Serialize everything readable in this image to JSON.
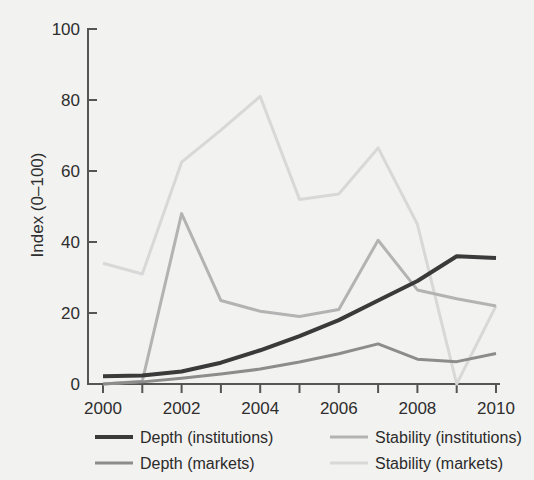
{
  "chart_data": {
    "type": "line",
    "title": "",
    "subtitle": "",
    "xlabel": "",
    "ylabel": "Index (0–100)",
    "x": [
      2000,
      2001,
      2002,
      2003,
      2004,
      2005,
      2006,
      2007,
      2008,
      2009,
      2010
    ],
    "xlim": [
      2000,
      2010
    ],
    "ylim": [
      0,
      100
    ],
    "xticks": [
      2000,
      2001,
      2002,
      2003,
      2004,
      2005,
      2006,
      2007,
      2008,
      2009,
      2010
    ],
    "xticklabels": [
      "2000",
      "",
      "2002",
      "",
      "2004",
      "",
      "2006",
      "",
      "2008",
      "",
      "2010"
    ],
    "yticks": [
      0,
      20,
      40,
      60,
      80,
      100
    ],
    "yticklabels": [
      "0",
      "20",
      "40",
      "60",
      "80",
      "100"
    ],
    "grid": false,
    "legend_position": "below",
    "series": [
      {
        "name": "Depth (institutions)",
        "color": "#3a3a3a",
        "width": 4,
        "values": [
          2.2,
          2.4,
          3.5,
          6.0,
          9.5,
          13.5,
          18.0,
          23.5,
          29.0,
          36.0,
          35.5
        ]
      },
      {
        "name": "Depth (markets)",
        "color": "#8c8c8c",
        "width": 3,
        "values": [
          0.0,
          0.6,
          1.6,
          2.8,
          4.2,
          6.2,
          8.5,
          11.3,
          7.0,
          6.3,
          8.6
        ]
      },
      {
        "name": "Stability (institutions)",
        "color": "#b3b3b3",
        "width": 3,
        "values": [
          0.0,
          0.8,
          48.0,
          23.5,
          20.5,
          19.0,
          21.0,
          40.5,
          26.5,
          24.0,
          22.0
        ]
      },
      {
        "name": "Stability (markets)",
        "color": "#d8d8d8",
        "width": 3,
        "values": [
          34.0,
          31.0,
          62.5,
          71.5,
          81.0,
          52.0,
          53.5,
          66.5,
          45.0,
          0.0,
          22.0
        ]
      }
    ]
  },
  "legend": {
    "entries": [
      {
        "label": "Depth (institutions)",
        "color": "#3a3a3a",
        "width": 4
      },
      {
        "label": "Stability (institutions)",
        "color": "#b3b3b3",
        "width": 3
      },
      {
        "label": "Depth (markets)",
        "color": "#8c8c8c",
        "width": 3
      },
      {
        "label": "Stability (markets)",
        "color": "#d8d8d8",
        "width": 3
      }
    ]
  },
  "style": {
    "background": "#f2f2f0",
    "axis_color": "#555555",
    "text_color": "#2e2e2e"
  }
}
